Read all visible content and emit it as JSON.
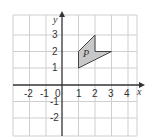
{
  "diagram": {
    "x_axis_label": "x",
    "y_axis_label": "y",
    "x_ticks": [
      "-2",
      "-1",
      "0",
      "1",
      "2",
      "3",
      "4"
    ],
    "y_ticks": [
      "3",
      "2",
      "1",
      "-1",
      "-2"
    ],
    "shape_label": "P",
    "shape_vertices": [
      [
        1,
        1
      ],
      [
        1,
        2
      ],
      [
        2,
        3
      ],
      [
        2,
        2
      ],
      [
        3,
        2
      ]
    ],
    "colors": {
      "grid": "#c8c8c8",
      "axis": "#333333",
      "shape_fill": "#c8c8c8",
      "shape_stroke": "#333333"
    }
  }
}
